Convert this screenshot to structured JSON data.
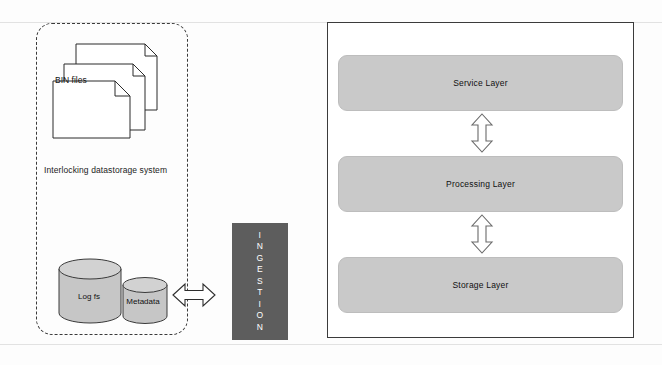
{
  "diagram": {
    "colors": {
      "ingestion_fill": "#5d5d5d",
      "layer_fill": "#c9c9c9",
      "panel_border": "#3b3b3b",
      "dashed_border": "#3a3a3a",
      "text": "#111111",
      "ingestion_text": "#ffffff"
    }
  },
  "storage_group": {
    "label": "Interlocking datastorage system",
    "files": {
      "label": "BIN files",
      "icon": "document-stack-icon",
      "count": 3
    },
    "cylinders": [
      {
        "label": "Log fs",
        "icon": "database-cylinder-icon",
        "size": "large"
      },
      {
        "label": "Metadata",
        "icon": "database-cylinder-icon",
        "size": "small"
      }
    ]
  },
  "connector": {
    "horizontal_arrow": "double-headed-horizontal-arrow-icon"
  },
  "ingestion": {
    "label": "INGESTION",
    "letters": [
      "I",
      "N",
      "G",
      "E",
      "S",
      "T",
      "I",
      "O",
      "N"
    ]
  },
  "platform": {
    "layers": [
      {
        "label": "Service Layer"
      },
      {
        "label": "Processing Layer"
      },
      {
        "label": "Storage Layer"
      }
    ],
    "vertical_arrows": [
      "double-headed-vertical-arrow-icon",
      "double-headed-vertical-arrow-icon"
    ]
  }
}
